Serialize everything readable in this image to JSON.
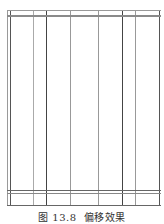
{
  "figure": {
    "caption_number": "图 13.8",
    "caption_title": "偏移效果",
    "caption": "图 13.8  偏移效果",
    "frame": {
      "left": 7,
      "top": 10,
      "right": 160,
      "bottom": 206
    },
    "vertical_lines": [
      {
        "x": 7,
        "color": "#9a9a9a",
        "width": 1
      },
      {
        "x": 10,
        "color": "#555555",
        "width": 1
      },
      {
        "x": 33,
        "color": "#aaaaaa",
        "width": 1
      },
      {
        "x": 46,
        "color": "#444444",
        "width": 1
      },
      {
        "x": 70,
        "color": "#999999",
        "width": 1
      },
      {
        "x": 98,
        "color": "#999999",
        "width": 1
      },
      {
        "x": 122,
        "color": "#444444",
        "width": 1
      },
      {
        "x": 135,
        "color": "#999999",
        "width": 1
      },
      {
        "x": 159,
        "color": "#555555",
        "width": 1
      }
    ],
    "horizontal_lines": [
      {
        "y": 10,
        "color": "#999999",
        "width": 1
      },
      {
        "y": 15,
        "color": "#8a8a8a",
        "width": 2
      },
      {
        "y": 190,
        "color": "#666666",
        "width": 1
      },
      {
        "y": 193,
        "color": "#888888",
        "width": 1
      },
      {
        "y": 205,
        "color": "#666666",
        "width": 1
      }
    ]
  }
}
